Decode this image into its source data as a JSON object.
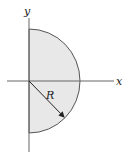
{
  "diagram": {
    "title": "",
    "axes": {
      "x_label": "x",
      "y_label": "y"
    },
    "shape": {
      "type": "semicircle",
      "side": "right half-plane",
      "fill": "#e8e8e8",
      "stroke": "#555555"
    },
    "radius_label": "R",
    "colors": {
      "axis": "#666666",
      "arrow": "#222222"
    }
  }
}
